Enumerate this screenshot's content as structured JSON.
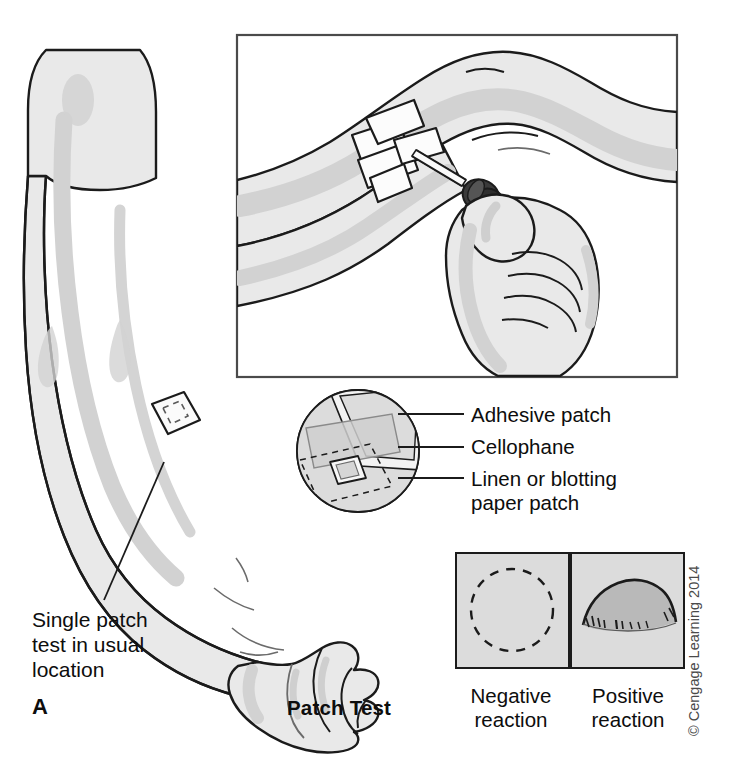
{
  "figure": {
    "panel_letter": "A",
    "title": "Patch Test",
    "copyright": "© Cengage Learning 2014",
    "background_color": "#ffffff",
    "ink_color": "#0d0d0d",
    "skin_fill": "#e9e9e9",
    "skin_shadow": "#d2d2d2",
    "panel_fill": "#dcdcdc",
    "dropper_bulb_color": "#3a3a3a"
  },
  "arm_callout": {
    "label_line1": "Single patch",
    "label_line2": "test in usual",
    "label_line3": "location",
    "patch_shape": "rotated-square"
  },
  "inset": {
    "description": "Hand applying solution from a dropper onto a taped patch on the forearm"
  },
  "magnifier": {
    "labels": [
      {
        "id": "adhesive-patch",
        "text": "Adhesive patch"
      },
      {
        "id": "cellophane",
        "text": "Cellophane"
      },
      {
        "id": "linen-patch-line1",
        "text": "Linen or blotting"
      },
      {
        "id": "linen-patch-line2",
        "text": "paper patch"
      }
    ]
  },
  "reactions": {
    "negative": {
      "line1": "Negative",
      "line2": "reaction"
    },
    "positive": {
      "line1": "Positive",
      "line2": "reaction"
    }
  }
}
